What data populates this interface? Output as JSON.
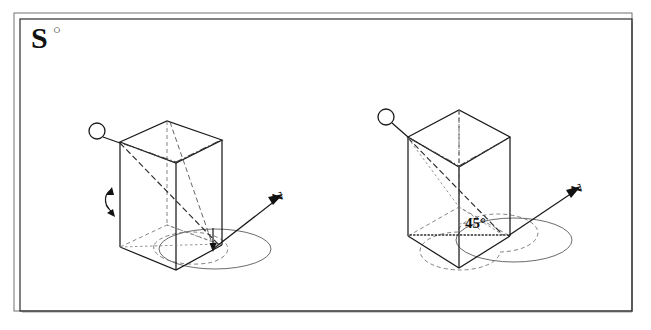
{
  "page": {
    "title": "S",
    "background_color": "#ffffff",
    "ink_color": "#1a1a1a",
    "width": 651,
    "height": 330
  },
  "frame": {
    "name": "double-rule-border",
    "outer_color": "#7d7d7d",
    "inner_color": "#2d2d2d",
    "shadow_color": "#bdbdbd"
  },
  "header": {
    "letter": "S",
    "superscript": "○"
  },
  "figures": [
    {
      "id": "left-figure",
      "name": "prism-face-forward",
      "caption_symbol": "↶",
      "axis_label": "Z",
      "angle_label": "",
      "callout_marker": "○",
      "description": "rectangular prism viewed with a face toward the viewer, vertical Z rotation axis, rotation circle at base"
    },
    {
      "id": "right-figure",
      "name": "prism-edge-forward",
      "caption_symbol": "",
      "axis_label": "Z",
      "angle_label": "45°",
      "callout_marker": "○",
      "description": "same prism rotated 45 degrees about the vertical Z axis so an edge faces the viewer"
    }
  ],
  "labels": {
    "axis_z_left": "Z",
    "axis_z_right": "Z",
    "angle_45": "45°",
    "rotation_symbol": "↶",
    "title_letter": "S",
    "title_degree": "○"
  }
}
